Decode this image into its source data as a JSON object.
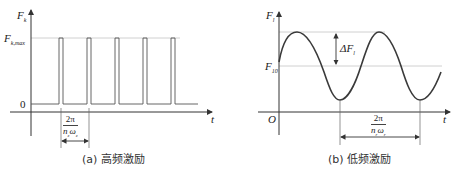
{
  "panel_a": {
    "caption": "(a) 高频激励",
    "y_axis_label": "F",
    "y_axis_sub": "k",
    "max_label": "F",
    "max_label_sub": "k,max",
    "zero_label": "0",
    "x_axis_label": "t",
    "period_numerator": "2π",
    "period_denominator_n": "n",
    "period_denominator_n_sub": "z",
    "period_denominator_w": "ω",
    "period_denominator_w_sub": "z",
    "pulse_count": 5
  },
  "panel_b": {
    "caption": "(b) 低频激励",
    "y_axis_label": "F",
    "y_axis_sub": "l",
    "mean_label": "F",
    "mean_label_sub": "10",
    "origin_label": "O",
    "amplitude_label": "ΔF",
    "amplitude_sub": "l",
    "x_axis_label": "t",
    "period_numerator": "2π",
    "period_denominator_n": "n",
    "period_denominator_n_sub": "r",
    "period_denominator_w": "ω",
    "period_denominator_w_sub": "r"
  },
  "colors": {
    "axis": "#333333",
    "signal": "#3a3a3a",
    "guide": "#bbbbbb"
  }
}
